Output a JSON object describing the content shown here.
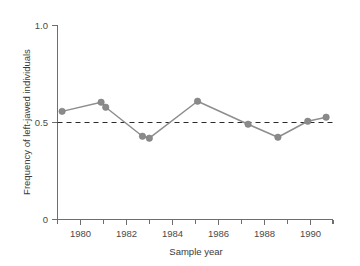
{
  "chart_data": {
    "type": "line",
    "title": "",
    "xlabel": "Sample year",
    "ylabel": "Frequency of left-jawed individuals",
    "xlim": [
      1979.0,
      1991.0
    ],
    "ylim": [
      0.0,
      1.0
    ],
    "grid": false,
    "legend": "none",
    "marker": "filled-circle",
    "series_color": "#8a8a8a",
    "x": [
      1979.2,
      1980.9,
      1981.1,
      1982.7,
      1983.0,
      1985.1,
      1987.3,
      1988.6,
      1989.9,
      1990.7
    ],
    "values": [
      0.556,
      0.603,
      0.577,
      0.428,
      0.418,
      0.608,
      0.49,
      0.423,
      0.505,
      0.526
    ],
    "points": [
      {
        "x": 1979.2,
        "y": 0.556
      },
      {
        "x": 1980.9,
        "y": 0.603
      },
      {
        "x": 1981.1,
        "y": 0.577
      },
      {
        "x": 1982.7,
        "y": 0.428
      },
      {
        "x": 1983.0,
        "y": 0.418
      },
      {
        "x": 1985.1,
        "y": 0.608
      },
      {
        "x": 1987.3,
        "y": 0.49
      },
      {
        "x": 1988.6,
        "y": 0.423
      },
      {
        "x": 1989.9,
        "y": 0.505
      },
      {
        "x": 1990.7,
        "y": 0.526
      }
    ],
    "annotations": [
      {
        "type": "hline",
        "y": 0.5,
        "style": "dashed",
        "color": "#2b2b2b",
        "label": ""
      }
    ],
    "x_ticks": [
      1980,
      1982,
      1984,
      1986,
      1988,
      1990
    ],
    "x_tick_labels": [
      "1980",
      "1982",
      "1984",
      "1986",
      "1988",
      "1990"
    ],
    "x_minor_ticks": [
      1979,
      1981,
      1983,
      1985,
      1987,
      1989,
      1991
    ],
    "y_ticks": [
      0,
      0.5,
      1.0
    ],
    "y_tick_labels": [
      "0",
      "0.5",
      "1.0"
    ]
  },
  "axes": {
    "x_title": "Sample year",
    "y_title": "Frequency of left-jawed individuals"
  }
}
